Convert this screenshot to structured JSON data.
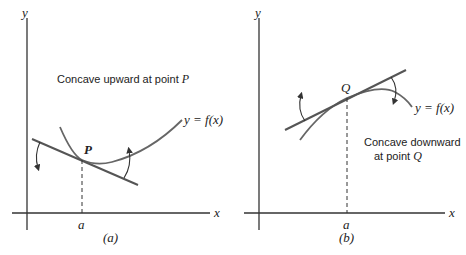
{
  "panels": [
    {
      "id": "a",
      "caption": "(a)",
      "axis_x_label": "x",
      "axis_y_label": "y",
      "tick_label": "a",
      "point_label": "P",
      "curve_label": "y = f(x)",
      "description": "Concave upward at point P",
      "description_prefix": "Concave upward at point ",
      "description_point": "P"
    },
    {
      "id": "b",
      "caption": "(b)",
      "axis_x_label": "x",
      "axis_y_label": "y",
      "tick_label": "a",
      "point_label": "Q",
      "curve_label": "y = f(x)",
      "description_line1": "Concave downward",
      "description_line2_prefix": "at point ",
      "description_point": "Q"
    }
  ],
  "colors": {
    "axes": "#333333",
    "curve": "#666666",
    "tangent": "#555555"
  }
}
